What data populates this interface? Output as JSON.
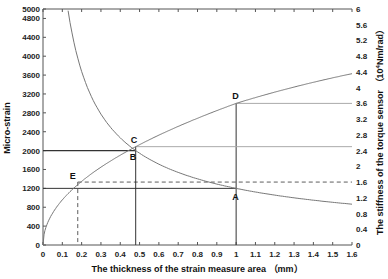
{
  "chart_data": {
    "type": "line",
    "title": "",
    "xlabel": "The thickness of the strain measure area  （mm）",
    "ylabel": "Micro-strain",
    "y2label": "The stiffness of the torque sensor （10^4Nm/rad）",
    "xlim": [
      0,
      1.6
    ],
    "ylim": [
      0,
      5000
    ],
    "y2lim": [
      0,
      6
    ],
    "x_ticks": [
      "0",
      "0.1",
      "0.2",
      "0.3",
      "0.4",
      "0.5",
      "0.6",
      "0.7",
      "0.8",
      "0.9",
      "1",
      "1.1",
      "1.2",
      "1.3",
      "1.4",
      "1.5",
      "1.6"
    ],
    "y_ticks": [
      "0",
      "400",
      "800",
      "1200",
      "1600",
      "2000",
      "2400",
      "2800",
      "3200",
      "3600",
      "4000",
      "4400",
      "4800",
      "5000"
    ],
    "y2_ticks": [
      "0",
      "0.4",
      "0.8",
      "1.2",
      "1.6",
      "2",
      "2.4",
      "2.8",
      "3.2",
      "3.6",
      "4",
      "4.4",
      "4.8",
      "5.2",
      "5.6",
      "6"
    ],
    "grid": false,
    "series": [
      {
        "name": "Micro-strain",
        "axis": "left",
        "x": [
          0.13,
          0.2,
          0.3,
          0.4,
          0.48,
          0.6,
          0.7,
          0.8,
          0.9,
          1.0,
          1.1,
          1.2,
          1.3,
          1.4,
          1.5,
          1.6
        ],
        "values": [
          5000,
          3680,
          2770,
          2270,
          2000,
          1710,
          1530,
          1400,
          1290,
          1200,
          1120,
          1060,
          1000,
          950,
          900,
          860
        ]
      },
      {
        "name": "Stiffness of the torque sensor (10^4 Nm/rad)",
        "axis": "right",
        "x": [
          0,
          0.02,
          0.05,
          0.1,
          0.18,
          0.3,
          0.48,
          0.6,
          0.8,
          1.0,
          1.2,
          1.4,
          1.6
        ],
        "values": [
          0,
          0.5,
          0.8,
          1.14,
          1.6,
          1.97,
          2.5,
          2.79,
          3.22,
          3.6,
          3.9,
          4.15,
          4.4
        ]
      }
    ],
    "annotations": [
      {
        "label": "A",
        "x": 1.0,
        "y": 1200,
        "axis": "left"
      },
      {
        "label": "B",
        "x": 0.48,
        "y": 2000,
        "axis": "left"
      },
      {
        "label": "C",
        "x": 0.48,
        "y": 2.5,
        "axis": "right"
      },
      {
        "label": "D",
        "x": 1.0,
        "y": 3.6,
        "axis": "right"
      },
      {
        "label": "E",
        "x": 0.18,
        "y": 1.6,
        "axis": "right"
      }
    ]
  },
  "labels": {
    "xlabel": "The thickness of the strain measure area  （mm）",
    "ylabel": "Micro-strain",
    "y2label_pre": "The stiffness of the torque sensor （10",
    "y2label_sup": "4",
    "y2label_post": "Nm/rad）"
  },
  "colors": {
    "curve": "#777777",
    "guide": "#333333",
    "axis": "#555555"
  }
}
